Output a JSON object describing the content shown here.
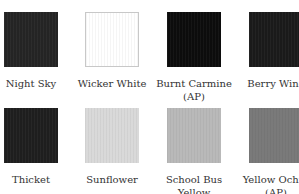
{
  "swatches": [
    {
      "name": "Night Sky",
      "color": "#242424",
      "border": "none"
    },
    {
      "name": "Wicker White",
      "color": "#ffffff",
      "border": "1px solid #c8c8c8"
    },
    {
      "name": "Burnt Carmine (AP)",
      "color": "#0c0c0c",
      "border": "none"
    },
    {
      "name": "Berry Wine",
      "color": "#1a1a1a",
      "border": "none"
    },
    {
      "name": "Thicket",
      "color": "#1e1e1e",
      "border": "none"
    },
    {
      "name": "Sunflower",
      "color": "#d9d9d9",
      "border": "none"
    },
    {
      "name": "School Bus Yellow",
      "color": "#b9b9b9",
      "border": "none"
    },
    {
      "name": "Yellow Ochre (AP)",
      "color": "#7a7a7a",
      "border": "none"
    }
  ],
  "labels": [
    "Night Sky",
    "Wicker White",
    "Burnt Carmine (AP)",
    "Berry Wine",
    "Thicket",
    "Sunflower",
    "School Bus Yellow",
    "Yellow Ochre (AP)"
  ]
}
